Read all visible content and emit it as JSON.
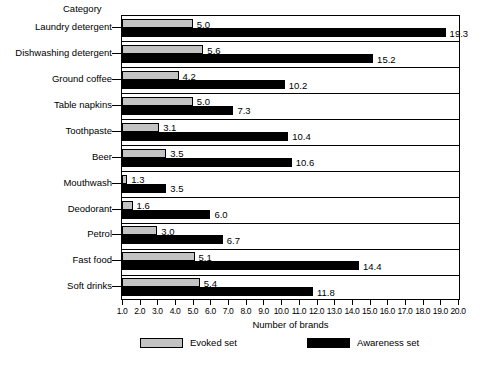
{
  "chart_data": {
    "type": "bar",
    "orientation": "horizontal",
    "title": "",
    "xlabel": "Number of brands",
    "ylabel": "Category",
    "xlim": [
      1.0,
      20.0
    ],
    "xticks": [
      "1.0",
      "2.0",
      "3.0",
      "4.0",
      "5.0",
      "6.0",
      "7.0",
      "8.0",
      "9.0",
      "10.0",
      "11.0",
      "12.0",
      "13.0",
      "14.0",
      "15.0",
      "16.0",
      "17.0",
      "18.0",
      "19.0",
      "20.0"
    ],
    "grid": false,
    "legend_position": "bottom",
    "categories": [
      "Laundry detergent",
      "Dishwashing detergent",
      "Ground coffee",
      "Table napkins",
      "Toothpaste",
      "Beer",
      "Mouthwash",
      "Deodorant",
      "Petrol",
      "Fast food",
      "Soft drinks"
    ],
    "series": [
      {
        "name": "Evoked set",
        "color": "#c3c3c3",
        "values": [
          5.0,
          5.6,
          4.2,
          5.0,
          3.1,
          3.5,
          1.3,
          1.6,
          3.0,
          5.1,
          5.4
        ],
        "labels": [
          "5.0",
          "5.6",
          "4.2",
          "5.0",
          "3.1",
          "3.5",
          "1.3",
          "1.6",
          "3.0",
          "5.1",
          "5.4"
        ]
      },
      {
        "name": "Awareness set",
        "color": "#000000",
        "values": [
          19.3,
          15.2,
          10.2,
          7.3,
          10.4,
          10.6,
          3.5,
          6.0,
          6.7,
          14.4,
          11.8
        ],
        "labels": [
          "19.3",
          "15.2",
          "10.2",
          "7.3",
          "10.4",
          "10.6",
          "3.5",
          "6.0",
          "6.7",
          "14.4",
          "11.8"
        ]
      }
    ]
  },
  "legend": {
    "items": [
      {
        "label": "Evoked set",
        "swatch": "evoked"
      },
      {
        "label": "Awareness set",
        "swatch": "awareness"
      }
    ]
  }
}
